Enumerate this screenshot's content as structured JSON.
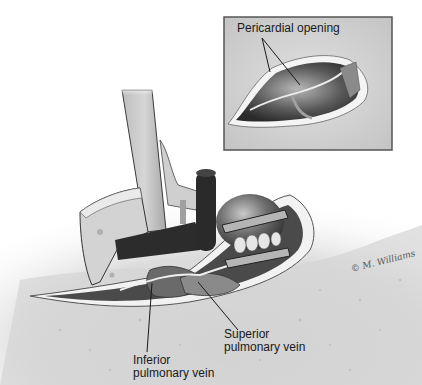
{
  "figure": {
    "inset": {
      "label": "Pericardial opening"
    },
    "labels": {
      "superior": [
        "Superior",
        "pulmonary vein"
      ],
      "inferior": [
        "Inferior",
        "pulmonary vein"
      ]
    },
    "signature": "© M. Williams",
    "colors": {
      "background": "#ffffff",
      "tissue_light": "#d8d8d8",
      "tissue_mid": "#9a9a9a",
      "tissue_dark": "#3a3a3a",
      "instrument_light": "#c8c8c8",
      "instrument_dark": "#2a2a2a",
      "outline": "#333333"
    }
  }
}
